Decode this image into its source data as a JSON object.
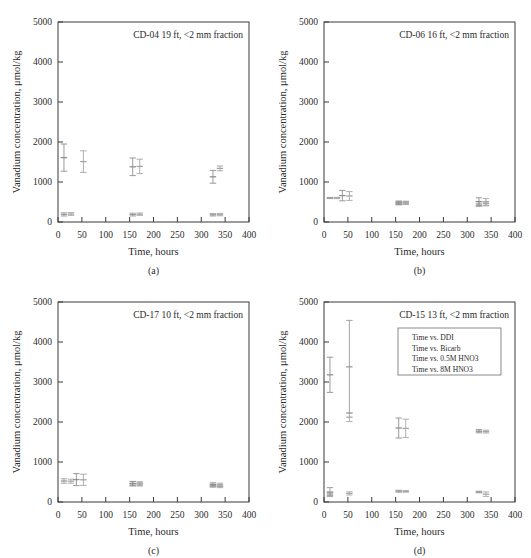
{
  "figure": {
    "xlabel": "Time, hours",
    "ylabel": "Vanadium concentration, μmol/kg",
    "xticks": [
      "0",
      "50",
      "100",
      "150",
      "200",
      "250",
      "300",
      "350",
      "400"
    ],
    "yticks": [
      "0",
      "1000",
      "2000",
      "3000",
      "4000",
      "5000"
    ],
    "xlim": [
      0,
      400
    ],
    "ylim": [
      0,
      5000
    ],
    "legend": {
      "position": "upper-right-panel-d",
      "entries": [
        {
          "label": "Time vs. DDI",
          "color": "#8a8a8a"
        },
        {
          "label": "Time vs. Bicarb",
          "color": "#9a9a9a"
        },
        {
          "label": "Time vs. 0.5M HNO3",
          "color": "#8f8f8f"
        },
        {
          "label": "Time vs. 8M HNO3",
          "color": "#a2a2a2"
        }
      ]
    }
  },
  "panels": [
    {
      "id": "a",
      "caption": "(a)",
      "title": "CD-04 19 ft, <2 mm fraction"
    },
    {
      "id": "b",
      "caption": "(b)",
      "title": "CD-06 16 ft, <2 mm fraction"
    },
    {
      "id": "c",
      "caption": "(c)",
      "title": "CD-17 10 ft, <2 mm fraction"
    },
    {
      "id": "d",
      "caption": "(d)",
      "title": "CD-15 13 ft, <2 mm fraction"
    }
  ],
  "chart_data": [
    {
      "type": "scatter",
      "panel": "a",
      "title": "CD-04 19 ft, <2 mm fraction",
      "xlabel": "Time, hours",
      "ylabel": "Vanadium concentration, μmol/kg",
      "xlim": [
        0,
        400
      ],
      "ylim": [
        0,
        5000
      ],
      "grid": false,
      "series": [
        {
          "name": "Time vs. DDI",
          "x": [
            24,
            168,
            336
          ],
          "y": [
            190,
            185,
            180
          ],
          "yerr": [
            40,
            35,
            30
          ]
        },
        {
          "name": "Time vs. Bicarb",
          "x": [
            24,
            168,
            336
          ],
          "y": [
            200,
            195,
            185
          ],
          "yerr": [
            35,
            30,
            30
          ]
        },
        {
          "name": "Time vs. 0.5M HNO3",
          "x": [
            24,
            168,
            336
          ],
          "y": [
            1610,
            1380,
            1130
          ],
          "yerr": [
            340,
            220,
            160
          ]
        },
        {
          "name": "Time vs. 8M HNO3",
          "x": [
            50,
            168,
            336
          ],
          "y": [
            1510,
            1390,
            1340
          ],
          "yerr": [
            270,
            180,
            60
          ]
        }
      ]
    },
    {
      "type": "scatter",
      "panel": "b",
      "title": "CD-06 16 ft, <2 mm fraction",
      "xlabel": "Time, hours",
      "ylabel": "Vanadium concentration, μmol/kg",
      "xlim": [
        0,
        400
      ],
      "ylim": [
        0,
        5000
      ],
      "grid": false,
      "series": [
        {
          "name": "Time vs. DDI",
          "x": [
            24,
            168,
            336
          ],
          "y": [
            600,
            470,
            450
          ],
          "yerr": [
            15,
            40,
            60
          ]
        },
        {
          "name": "Time vs. Bicarb",
          "x": [
            24,
            168,
            336
          ],
          "y": [
            600,
            475,
            460
          ],
          "yerr": [
            15,
            35,
            55
          ]
        },
        {
          "name": "Time vs. 0.5M HNO3",
          "x": [
            50,
            168,
            336
          ],
          "y": [
            660,
            480,
            510
          ],
          "yerr": [
            130,
            45,
            95
          ]
        },
        {
          "name": "Time vs. 8M HNO3",
          "x": [
            50,
            168,
            336
          ],
          "y": [
            650,
            480,
            500
          ],
          "yerr": [
            110,
            40,
            85
          ]
        }
      ]
    },
    {
      "type": "scatter",
      "panel": "c",
      "title": "CD-17 10 ft, <2 mm fraction",
      "xlabel": "Time, hours",
      "ylabel": "Vanadium concentration, μmol/kg",
      "xlim": [
        0,
        400
      ],
      "ylim": [
        0,
        5000
      ],
      "grid": false,
      "series": [
        {
          "name": "Time vs. DDI",
          "x": [
            24,
            168,
            336
          ],
          "y": [
            525,
            455,
            400
          ],
          "yerr": [
            55,
            50,
            30
          ]
        },
        {
          "name": "Time vs. Bicarb",
          "x": [
            24,
            168,
            336
          ],
          "y": [
            520,
            450,
            390
          ],
          "yerr": [
            50,
            45,
            30
          ]
        },
        {
          "name": "Time vs. 0.5M HNO3",
          "x": [
            50,
            168,
            336
          ],
          "y": [
            560,
            460,
            440
          ],
          "yerr": [
            150,
            55,
            40
          ]
        },
        {
          "name": "Time vs. 8M HNO3",
          "x": [
            50,
            168,
            336
          ],
          "y": [
            555,
            455,
            430
          ],
          "yerr": [
            140,
            50,
            40
          ]
        }
      ]
    },
    {
      "type": "scatter",
      "panel": "d",
      "title": "CD-15 13 ft, <2 mm fraction",
      "xlabel": "Time, hours",
      "ylabel": "Vanadium concentration, μmol/kg",
      "xlim": [
        0,
        400
      ],
      "ylim": [
        0,
        5000
      ],
      "grid": false,
      "series": [
        {
          "name": "Time vs. DDI",
          "x": [
            24,
            168,
            336
          ],
          "y": [
            250,
            270,
            250
          ],
          "yerr": [
            110,
            25,
            20
          ]
        },
        {
          "name": "Time vs. Bicarb",
          "x": [
            50,
            168,
            336
          ],
          "y": [
            215,
            265,
            195
          ],
          "yerr": [
            40,
            20,
            55
          ]
        },
        {
          "name": "Time vs. 0.5M HNO3",
          "x": [
            24,
            168,
            336
          ],
          "y": [
            3180,
            1850,
            1770
          ],
          "yerr": [
            440,
            250,
            40
          ]
        },
        {
          "name": "Time vs. 8M HNO3",
          "x": [
            50,
            168,
            336
          ],
          "y": [
            2120,
            1840,
            1760
          ],
          "yerr": [
            110,
            230,
            35
          ]
        },
        {
          "name": "Time vs. 0.5M HNO3 (tall)",
          "x": [
            50
          ],
          "y": [
            3380
          ],
          "yerr": [
            1160
          ]
        },
        {
          "name": "Time vs. DDI (low pair)",
          "x": [
            24
          ],
          "y": [
            200
          ],
          "yerr": [
            40
          ]
        }
      ]
    }
  ]
}
